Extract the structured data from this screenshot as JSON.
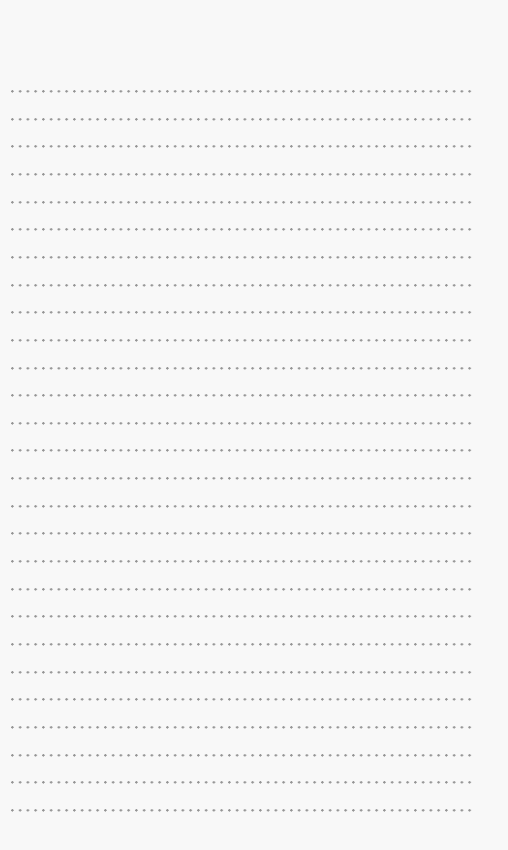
{
  "page": {
    "type": "dotted-line notebook paper",
    "background_color": "#f8f8f8",
    "dot_color": "#8e8e8e",
    "row_count": 27,
    "first_row_y": 90,
    "row_spacing": 27.65,
    "text": ""
  }
}
